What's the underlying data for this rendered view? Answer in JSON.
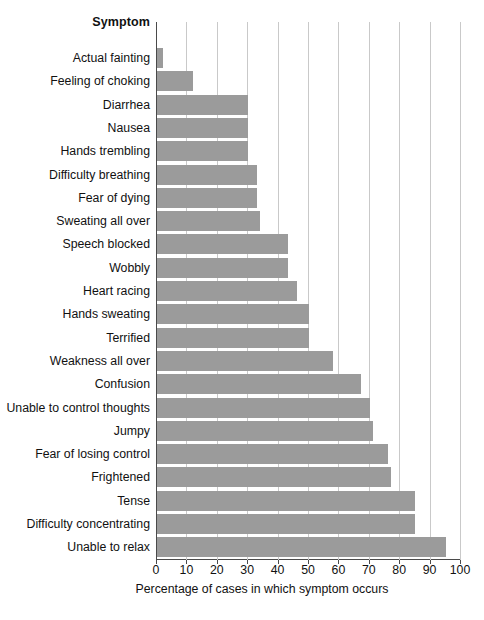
{
  "chart_data": {
    "type": "bar",
    "orientation": "horizontal",
    "title": "",
    "xlabel": "Percentage of cases in which symptom occurs",
    "ylabel": "Symptom",
    "xlim": [
      0,
      100
    ],
    "xticks": [
      0,
      10,
      20,
      30,
      40,
      50,
      60,
      70,
      80,
      90,
      100
    ],
    "grid": true,
    "grid_axis": "x",
    "legend": false,
    "bar_color": "#9b9b9b",
    "categories": [
      "Actual fainting",
      "Feeling of choking",
      "Diarrhea",
      "Nausea",
      "Hands trembling",
      "Difficulty breathing",
      "Fear of dying",
      "Sweating all over",
      "Speech blocked",
      "Wobbly",
      "Heart racing",
      "Hands sweating",
      "Terrified",
      "Weakness all over",
      "Confusion",
      "Unable to control thoughts",
      "Jumpy",
      "Fear of losing control",
      "Frightened",
      "Tense",
      "Difficulty concentrating",
      "Unable to relax"
    ],
    "values": [
      2,
      12,
      30,
      30,
      30,
      33,
      33,
      34,
      43,
      43,
      46,
      50,
      50,
      58,
      67,
      70,
      71,
      76,
      77,
      85,
      85,
      95
    ]
  },
  "header": {
    "column_title": "Symptom"
  },
  "axis": {
    "x_title": "Percentage of cases in which symptom occurs"
  }
}
